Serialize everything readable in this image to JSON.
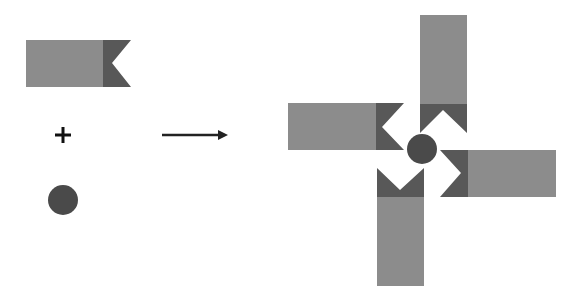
{
  "diagram": {
    "colors": {
      "background": "#ffffff",
      "flag_body": "#8c8c8c",
      "flag_notch": "#585858",
      "circle": "#4a4a4a",
      "arrow": "#222222",
      "plus": "#111111"
    },
    "components": {
      "flag": {
        "label": "flag-shape",
        "x": 26,
        "y": 40,
        "body_width": 77,
        "notch_width": 27,
        "height": 47
      },
      "plus_sign": {
        "symbol": "+",
        "x": 63,
        "y": 135
      },
      "circle": {
        "cx": 63,
        "cy": 200,
        "r": 15
      },
      "arrow": {
        "x1": 162,
        "y1": 135,
        "x2": 227,
        "y2": 135
      }
    },
    "result": {
      "label": "pinwheel",
      "center_circle": {
        "cx": 422,
        "cy": 149,
        "r": 15
      },
      "flags": [
        {
          "position": "top",
          "x": 420,
          "y": 15,
          "w": 47,
          "h": 118
        },
        {
          "position": "left",
          "x": 288,
          "y": 103,
          "w": 116,
          "h": 47
        },
        {
          "position": "right",
          "x": 439,
          "y": 150,
          "w": 117,
          "h": 47
        },
        {
          "position": "bottom",
          "x": 377,
          "y": 166,
          "w": 47,
          "h": 120
        }
      ]
    }
  }
}
